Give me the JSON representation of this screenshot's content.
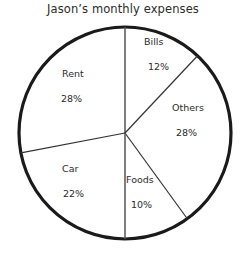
{
  "chart_data": {
    "type": "pie",
    "title": "Jason’s monthly expenses",
    "categories": [
      "Bills",
      "Others",
      "Foods",
      "Car",
      "Rent"
    ],
    "values": [
      12,
      28,
      10,
      22,
      28
    ],
    "value_suffix": "%",
    "labels": [
      {
        "name": "Bills",
        "value": "12%",
        "percent": 12
      },
      {
        "name": "Others",
        "value": "28%",
        "percent": 28
      },
      {
        "name": "Foods",
        "value": "10%",
        "percent": 10
      },
      {
        "name": "Car",
        "value": "22%",
        "percent": 22
      },
      {
        "name": "Rent",
        "value": "28%",
        "percent": 28
      }
    ],
    "start_angle_deg": 0,
    "direction": "clockwise",
    "legend": "none",
    "grid": false,
    "slice_fill": "#ffffff",
    "outline_color": "#1a1a1a",
    "divider_color": "#444444",
    "background": "#ffffff"
  }
}
